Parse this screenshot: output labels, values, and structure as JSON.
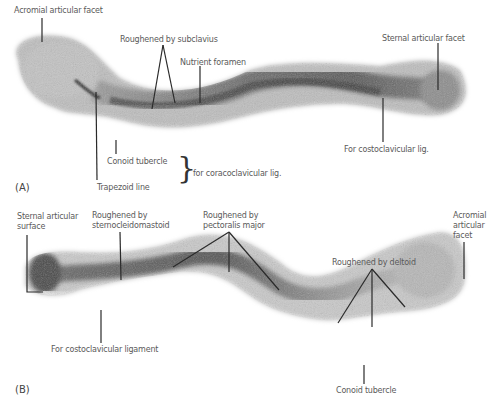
{
  "figure": {
    "panels": [
      {
        "id": "A",
        "panel_label": "(A)",
        "labels": {
          "acromial_articular_facet": "Acromial articular facet",
          "roughened_by_subclavius": "Roughened by subclavius",
          "nutrient_foramen": "Nutrient foramen",
          "sternal_articular_facet": "Sternal articular facet",
          "conoid_tubercle": "Conoid tubercle",
          "trapezoid_line": "Trapezoid line",
          "for_coracoclavicular_lig": "for coracoclavicular lig.",
          "for_costoclavicular_lig": "For costoclavicular lig."
        }
      },
      {
        "id": "B",
        "panel_label": "(B)",
        "labels": {
          "sternal_articular_surface_1": "Sternal articular",
          "sternal_articular_surface_2": "surface",
          "roughened_by_scm_1": "Roughened by",
          "roughened_by_scm_2": "sternocleidomastoid",
          "roughened_by_pec_1": "Roughened by",
          "roughened_by_pec_2": "pectoralis major",
          "roughened_by_deltoid": "Roughened by deltoid",
          "acromial_facet_1": "Acromial",
          "acromial_facet_2": "articular",
          "acromial_facet_3": "facet",
          "for_costoclavicular_ligament": "For costoclavicular ligament",
          "conoid_tubercle": "Conoid tubercle"
        }
      }
    ],
    "colors": {
      "label_text": "#5a5a5a",
      "leader_line": "#2a2a2a",
      "bone_dark": "#3c3c3c",
      "bone_mid": "#8a8a8a",
      "bone_light": "#cfcfcf"
    }
  }
}
